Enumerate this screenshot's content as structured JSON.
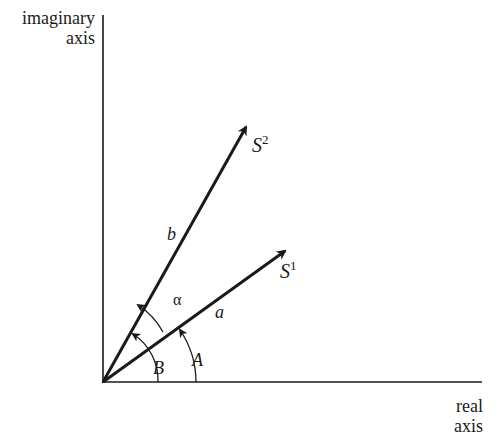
{
  "axes": {
    "y_label_line1": "imaginary",
    "y_label_line2": "axis",
    "x_label_line1": "real",
    "x_label_line2": "axis"
  },
  "vectors": [
    {
      "name": "S",
      "superscript": "2",
      "magnitude_label": "b",
      "angle_label": "B"
    },
    {
      "name": "S",
      "superscript": "1",
      "magnitude_label": "a",
      "angle_label": "A"
    }
  ],
  "angle_between": {
    "label": "α"
  },
  "colors": {
    "ink": "#1a1a1a",
    "background": "#ffffff"
  }
}
